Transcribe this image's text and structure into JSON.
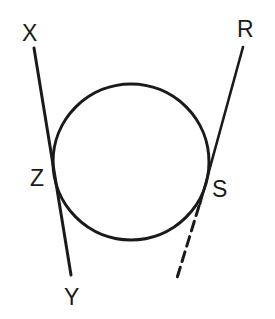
{
  "diagram": {
    "type": "geometry-tangent-lines",
    "stroke_color": "#1a1a1a",
    "background": "#ffffff",
    "circle": {
      "cx": 131,
      "cy": 162,
      "r": 78
    },
    "labels": {
      "X": "X",
      "Y": "Y",
      "Z": "Z",
      "R": "R",
      "S": "S"
    },
    "lines": [
      {
        "name": "line-XY",
        "from": "X",
        "to": "Y",
        "style": "solid",
        "tangent_point": "Z"
      },
      {
        "name": "line-RS",
        "from": "R",
        "to": "S",
        "style": "solid",
        "tangent_point": "S"
      },
      {
        "name": "line-RS-extension",
        "from": "S",
        "to": "",
        "style": "dashed"
      }
    ]
  }
}
